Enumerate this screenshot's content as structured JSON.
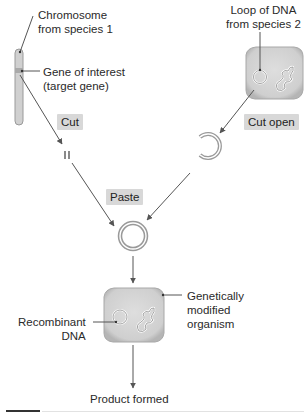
{
  "labels": {
    "chromosome": [
      "Chromosome",
      "from species 1"
    ],
    "gene": [
      "Gene of interest",
      "(target gene)"
    ],
    "loop": [
      "Loop of DNA",
      "from species 2"
    ],
    "recombinant": [
      "Recombinant",
      "DNA"
    ],
    "gmo": [
      "Genetically",
      "modified",
      "organism"
    ],
    "product": "Product formed"
  },
  "steps": {
    "cut": "Cut",
    "cut_open": "Cut open",
    "paste": "Paste"
  },
  "colors": {
    "tag_bg": "#d8d8d8",
    "cell_fill": "#d4d4d4",
    "cell_edge": "#a8a8a8",
    "line": "#555555",
    "ring": "#8c8c8c"
  }
}
